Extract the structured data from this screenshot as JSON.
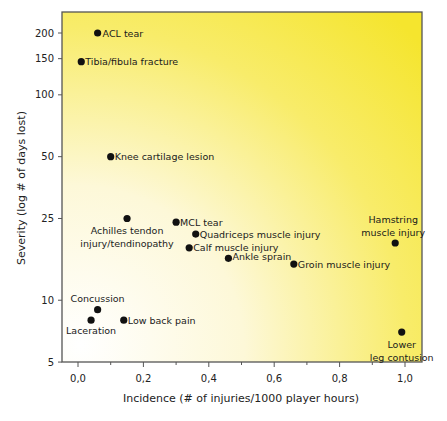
{
  "chart_data": {
    "type": "scatter",
    "title": "",
    "xlabel": "Incidence (# of injuries/1000 player hours)",
    "ylabel": "Severity (log # of days lost)",
    "xlim": [
      -0.05,
      1.05
    ],
    "ylim": [
      5,
      300
    ],
    "yscale": "log",
    "grid": false,
    "legend": null,
    "background": "yellow radial gradient (white lower-left to yellow upper-right)",
    "x_ticks": [
      "0,0",
      "0,2",
      "0,4",
      "0,6",
      "0,8",
      "1,0"
    ],
    "x_tick_values": [
      0,
      0.2,
      0.4,
      0.6,
      0.8,
      1.0
    ],
    "y_ticks": [
      "5",
      "10",
      "25",
      "50",
      "100",
      "150",
      "200"
    ],
    "y_tick_values": [
      5,
      10,
      25,
      50,
      100,
      150,
      200
    ],
    "points": [
      {
        "label": "ACL tear",
        "x": 0.06,
        "y": 200
      },
      {
        "label": "Tibia/fibula fracture",
        "x": 0.01,
        "y": 145
      },
      {
        "label": "Knee cartilage lesion",
        "x": 0.1,
        "y": 50
      },
      {
        "label": "Achilles tendon injury/tendinopathy",
        "x": 0.15,
        "y": 25
      },
      {
        "label": "MCL tear",
        "x": 0.3,
        "y": 24
      },
      {
        "label": "Quadriceps muscle injury",
        "x": 0.36,
        "y": 21
      },
      {
        "label": "Calf muscle injury",
        "x": 0.34,
        "y": 18
      },
      {
        "label": "Ankle sprain",
        "x": 0.46,
        "y": 16
      },
      {
        "label": "Groin muscle injury",
        "x": 0.66,
        "y": 15
      },
      {
        "label": "Hamstring muscle injury",
        "x": 0.97,
        "y": 19
      },
      {
        "label": "Concussion",
        "x": 0.06,
        "y": 9
      },
      {
        "label": "Laceration",
        "x": 0.04,
        "y": 8
      },
      {
        "label": "Low back pain",
        "x": 0.14,
        "y": 8
      },
      {
        "label": "Lower leg contusion",
        "x": 0.99,
        "y": 7
      }
    ]
  },
  "axes": {
    "x_title": "Incidence (# of injuries/1000 player hours)",
    "y_title": "Severity (log # of days lost)"
  },
  "colors": {
    "point": "#111111",
    "frame": "#555555",
    "bg_yellow": "#f7e53a",
    "bg_white": "#ffffff"
  }
}
